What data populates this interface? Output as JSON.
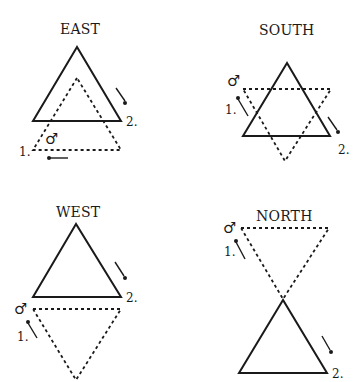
{
  "panels": [
    {
      "id": "east",
      "title": "EAST",
      "symbol": "♂",
      "labels": {
        "first": "1.",
        "second": "2."
      },
      "solid_triangle": {
        "orientation": "up"
      },
      "dashed_triangle": {
        "orientation": "up"
      }
    },
    {
      "id": "south",
      "title": "SOUTH",
      "symbol": "♂",
      "labels": {
        "first": "1.",
        "second": "2."
      },
      "solid_triangle": {
        "orientation": "up"
      },
      "dashed_triangle": {
        "orientation": "down"
      }
    },
    {
      "id": "west",
      "title": "WEST",
      "symbol": "♂",
      "labels": {
        "first": "1.",
        "second": "2."
      },
      "solid_triangle": {
        "orientation": "up"
      },
      "dashed_triangle": {
        "orientation": "down"
      }
    },
    {
      "id": "north",
      "title": "NORTH",
      "symbol": "♂",
      "labels": {
        "first": "1.",
        "second": "2."
      },
      "solid_triangle": {
        "orientation": "up"
      },
      "dashed_triangle": {
        "orientation": "down"
      }
    }
  ]
}
